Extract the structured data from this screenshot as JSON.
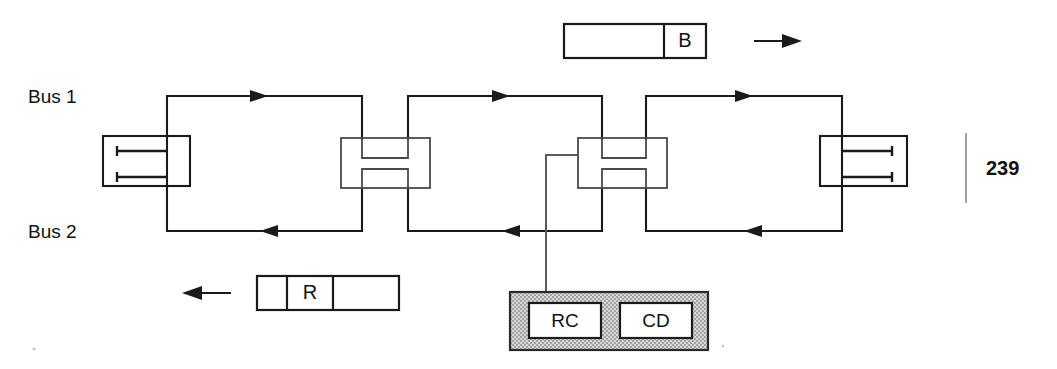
{
  "page": {
    "number": "239",
    "background_color": "#ffffff",
    "ink_color": "#1a1a1a"
  },
  "diagram": {
    "bus_labels": {
      "upper": "Bus 1",
      "lower": "Bus 2"
    },
    "bus_upper_direction": "right",
    "bus_lower_direction": "left",
    "nodes": [
      {
        "id": "node-1",
        "type": "terminator-left",
        "stub_direction": "right"
      },
      {
        "id": "node-2",
        "type": "repeater",
        "stub_direction": "none"
      },
      {
        "id": "node-3",
        "type": "repeater-with-station",
        "stub_direction": "none"
      },
      {
        "id": "node-4",
        "type": "terminator-right",
        "stub_direction": "left"
      }
    ]
  },
  "station": {
    "fill_color": "#c8c8c8",
    "modules": [
      {
        "id": "module-rc",
        "label": "RC"
      },
      {
        "id": "module-cd",
        "label": "CD"
      }
    ]
  },
  "frames": {
    "upper": {
      "id": "frame-busy",
      "direction": "right",
      "arrow_glyph": "→",
      "cells": [
        {
          "label": "",
          "width": 100
        },
        {
          "label": "B",
          "width": 42
        }
      ]
    },
    "lower": {
      "id": "frame-request",
      "direction": "left",
      "arrow_glyph": "←",
      "cells": [
        {
          "label": "",
          "width": 30
        },
        {
          "label": "R",
          "width": 46
        },
        {
          "label": "",
          "width": 66
        }
      ]
    }
  }
}
